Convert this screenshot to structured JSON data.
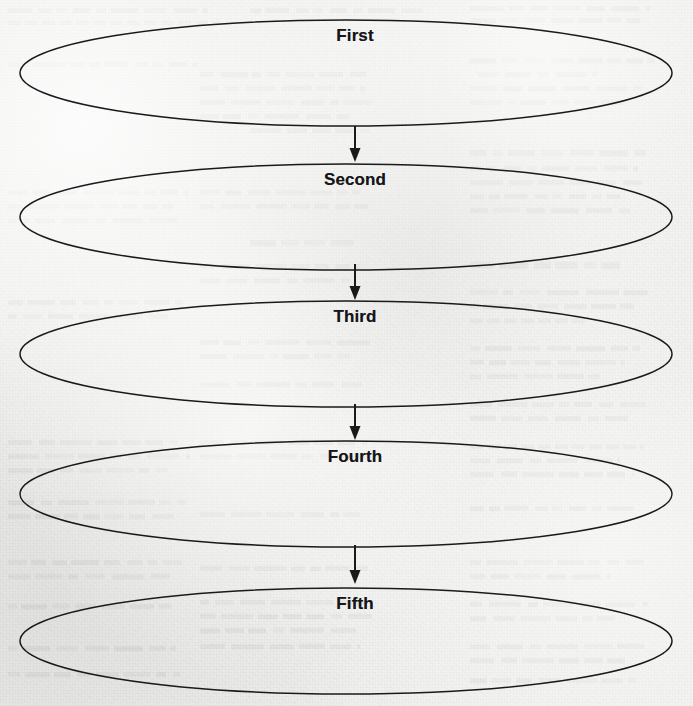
{
  "page": {
    "background_color": "#eeeeec",
    "ink_color": "#1a1a1a",
    "width": 693,
    "height": 706
  },
  "diagram": {
    "type": "flowchart",
    "shape": "ellipse",
    "orientation": "vertical",
    "connector": "arrow-down",
    "nodes": [
      {
        "label": "First",
        "cx": 346,
        "cy": 73,
        "rx": 326,
        "ry": 53,
        "label_x": 355,
        "label_y": 26
      },
      {
        "label": "Second",
        "cx": 346,
        "cy": 217,
        "rx": 326,
        "ry": 53,
        "label_x": 355,
        "label_y": 170
      },
      {
        "label": "Third",
        "cx": 346,
        "cy": 354,
        "rx": 326,
        "ry": 53,
        "label_x": 355,
        "label_y": 307
      },
      {
        "label": "Fourth",
        "cx": 346,
        "cy": 494,
        "rx": 326,
        "ry": 53,
        "label_x": 355,
        "label_y": 447
      },
      {
        "label": "Fifth",
        "cx": 346,
        "cy": 641,
        "rx": 326,
        "ry": 53,
        "label_x": 355,
        "label_y": 594
      }
    ],
    "arrows": [
      {
        "from": "First",
        "to": "Second",
        "x": 355,
        "y1": 126,
        "y2": 162
      },
      {
        "from": "Second",
        "to": "Third",
        "x": 355,
        "y1": 264,
        "y2": 300
      },
      {
        "from": "Third",
        "to": "Fourth",
        "x": 355,
        "y1": 404,
        "y2": 440
      },
      {
        "from": "Fourth",
        "to": "Fifth",
        "x": 355,
        "y1": 545,
        "y2": 584
      }
    ]
  },
  "background_page": {
    "description": "faint scanned book page showing through behind the diagram",
    "ghost_lines": [
      {
        "x": 8,
        "y": 8,
        "w": 200,
        "h": 5
      },
      {
        "x": 8,
        "y": 20,
        "w": 212,
        "h": 5
      },
      {
        "x": 250,
        "y": 8,
        "w": 175,
        "h": 5
      },
      {
        "x": 470,
        "y": 6,
        "w": 180,
        "h": 5
      },
      {
        "x": 470,
        "y": 18,
        "w": 170,
        "h": 5
      },
      {
        "x": 8,
        "y": 62,
        "w": 190,
        "h": 5
      },
      {
        "x": 470,
        "y": 58,
        "w": 185,
        "h": 5
      },
      {
        "x": 478,
        "y": 72,
        "w": 120,
        "h": 5
      },
      {
        "x": 470,
        "y": 86,
        "w": 175,
        "h": 5
      },
      {
        "x": 470,
        "y": 100,
        "w": 160,
        "h": 5
      },
      {
        "x": 200,
        "y": 72,
        "w": 170,
        "h": 5
      },
      {
        "x": 200,
        "y": 86,
        "w": 165,
        "h": 5
      },
      {
        "x": 200,
        "y": 100,
        "w": 172,
        "h": 5
      },
      {
        "x": 200,
        "y": 114,
        "w": 150,
        "h": 5
      },
      {
        "x": 250,
        "y": 128,
        "w": 120,
        "h": 5
      },
      {
        "x": 470,
        "y": 150,
        "w": 176,
        "h": 6
      },
      {
        "x": 470,
        "y": 166,
        "w": 168,
        "h": 5
      },
      {
        "x": 470,
        "y": 180,
        "w": 172,
        "h": 5
      },
      {
        "x": 470,
        "y": 194,
        "w": 150,
        "h": 5
      },
      {
        "x": 470,
        "y": 208,
        "w": 160,
        "h": 5
      },
      {
        "x": 8,
        "y": 190,
        "w": 180,
        "h": 5
      },
      {
        "x": 8,
        "y": 204,
        "w": 165,
        "h": 5
      },
      {
        "x": 8,
        "y": 218,
        "w": 170,
        "h": 5
      },
      {
        "x": 200,
        "y": 190,
        "w": 160,
        "h": 5
      },
      {
        "x": 200,
        "y": 204,
        "w": 168,
        "h": 5
      },
      {
        "x": 250,
        "y": 240,
        "w": 110,
        "h": 6
      },
      {
        "x": 470,
        "y": 262,
        "w": 150,
        "h": 7
      },
      {
        "x": 200,
        "y": 264,
        "w": 160,
        "h": 5
      },
      {
        "x": 200,
        "y": 278,
        "w": 150,
        "h": 5
      },
      {
        "x": 470,
        "y": 290,
        "w": 178,
        "h": 5
      },
      {
        "x": 470,
        "y": 304,
        "w": 164,
        "h": 5
      },
      {
        "x": 470,
        "y": 318,
        "w": 120,
        "h": 5
      },
      {
        "x": 8,
        "y": 300,
        "w": 175,
        "h": 5
      },
      {
        "x": 8,
        "y": 314,
        "w": 160,
        "h": 5
      },
      {
        "x": 200,
        "y": 340,
        "w": 170,
        "h": 5
      },
      {
        "x": 200,
        "y": 354,
        "w": 150,
        "h": 5
      },
      {
        "x": 470,
        "y": 346,
        "w": 170,
        "h": 5
      },
      {
        "x": 470,
        "y": 360,
        "w": 155,
        "h": 5
      },
      {
        "x": 470,
        "y": 374,
        "w": 130,
        "h": 5
      },
      {
        "x": 200,
        "y": 382,
        "w": 165,
        "h": 5
      },
      {
        "x": 470,
        "y": 402,
        "w": 176,
        "h": 5
      },
      {
        "x": 470,
        "y": 416,
        "w": 158,
        "h": 5
      },
      {
        "x": 8,
        "y": 440,
        "w": 170,
        "h": 5
      },
      {
        "x": 8,
        "y": 454,
        "w": 182,
        "h": 5
      },
      {
        "x": 8,
        "y": 468,
        "w": 160,
        "h": 5
      },
      {
        "x": 200,
        "y": 440,
        "w": 168,
        "h": 5
      },
      {
        "x": 200,
        "y": 454,
        "w": 172,
        "h": 5
      },
      {
        "x": 470,
        "y": 444,
        "w": 174,
        "h": 5
      },
      {
        "x": 470,
        "y": 458,
        "w": 150,
        "h": 5
      },
      {
        "x": 470,
        "y": 472,
        "w": 165,
        "h": 5
      },
      {
        "x": 8,
        "y": 500,
        "w": 178,
        "h": 5
      },
      {
        "x": 8,
        "y": 514,
        "w": 168,
        "h": 5
      },
      {
        "x": 200,
        "y": 512,
        "w": 160,
        "h": 5
      },
      {
        "x": 470,
        "y": 506,
        "w": 170,
        "h": 5
      },
      {
        "x": 8,
        "y": 560,
        "w": 176,
        "h": 5
      },
      {
        "x": 8,
        "y": 574,
        "w": 162,
        "h": 5
      },
      {
        "x": 200,
        "y": 566,
        "w": 168,
        "h": 5
      },
      {
        "x": 470,
        "y": 560,
        "w": 174,
        "h": 5
      },
      {
        "x": 470,
        "y": 574,
        "w": 140,
        "h": 5
      },
      {
        "x": 8,
        "y": 604,
        "w": 170,
        "h": 5
      },
      {
        "x": 200,
        "y": 600,
        "w": 166,
        "h": 5
      },
      {
        "x": 200,
        "y": 614,
        "w": 172,
        "h": 5
      },
      {
        "x": 200,
        "y": 628,
        "w": 160,
        "h": 5
      },
      {
        "x": 470,
        "y": 602,
        "w": 178,
        "h": 5
      },
      {
        "x": 470,
        "y": 616,
        "w": 150,
        "h": 5
      },
      {
        "x": 8,
        "y": 646,
        "w": 168,
        "h": 5
      },
      {
        "x": 200,
        "y": 644,
        "w": 160,
        "h": 5
      },
      {
        "x": 470,
        "y": 644,
        "w": 176,
        "h": 5
      },
      {
        "x": 470,
        "y": 658,
        "w": 158,
        "h": 5
      },
      {
        "x": 8,
        "y": 672,
        "w": 172,
        "h": 5
      },
      {
        "x": 470,
        "y": 678,
        "w": 166,
        "h": 5
      }
    ]
  }
}
